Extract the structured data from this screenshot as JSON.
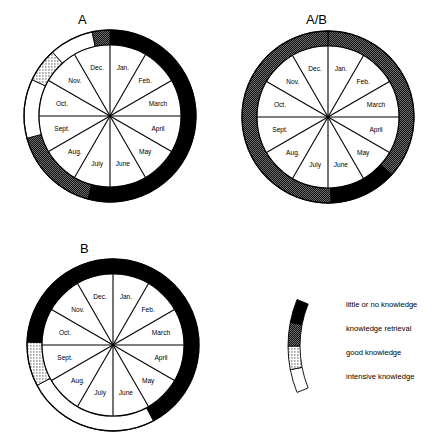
{
  "figure": {
    "background": "#ffffff",
    "ink": "#000000"
  },
  "panels": [
    {
      "id": "A",
      "title": "A",
      "title_x": 78,
      "title_y": 24,
      "cx": 110,
      "cy": 116,
      "r_outer": 86,
      "r_inner": 71,
      "months": [
        "Jan.",
        "Feb.",
        "March",
        "April",
        "May",
        "June",
        "July",
        "Aug.",
        "Sept.",
        "Oct.",
        "Nov.",
        "Dec."
      ],
      "ring": [
        {
          "from_deg": -90,
          "to_deg": 105,
          "fill": "intensive knowledge"
        },
        {
          "from_deg": 105,
          "to_deg": 165,
          "fill": "good knowledge"
        },
        {
          "from_deg": 165,
          "to_deg": 205,
          "fill": "little or no knowledge"
        },
        {
          "from_deg": 205,
          "to_deg": 228,
          "fill": "knowledge retrieval"
        },
        {
          "from_deg": 228,
          "to_deg": 258,
          "fill": "little or no knowledge"
        },
        {
          "from_deg": 258,
          "to_deg": 270,
          "fill": "good knowledge"
        }
      ]
    },
    {
      "id": "A/B",
      "title": "A/B",
      "title_x": 306,
      "title_y": 24,
      "cx": 328,
      "cy": 117,
      "r_outer": 86,
      "r_inner": 71,
      "months": [
        "Jan.",
        "Feb.",
        "March",
        "April",
        "May",
        "June",
        "July",
        "Aug.",
        "Sept.",
        "Oct.",
        "Nov.",
        "Dec."
      ],
      "ring": [
        {
          "from_deg": -90,
          "to_deg": 42,
          "fill": "good knowledge"
        },
        {
          "from_deg": 42,
          "to_deg": 88,
          "fill": "intensive knowledge"
        },
        {
          "from_deg": 88,
          "to_deg": 270,
          "fill": "good knowledge"
        }
      ]
    },
    {
      "id": "B",
      "title": "B",
      "title_x": 80,
      "title_y": 253,
      "cx": 113,
      "cy": 345,
      "r_outer": 86,
      "r_inner": 71,
      "months": [
        "Jan.",
        "Feb.",
        "March",
        "April",
        "May",
        "June",
        "July",
        "Aug.",
        "Sept.",
        "Oct.",
        "Nov.",
        "Dec."
      ],
      "ring": [
        {
          "from_deg": -90,
          "to_deg": 62,
          "fill": "intensive knowledge"
        },
        {
          "from_deg": 62,
          "to_deg": 152,
          "fill": "little or no knowledge"
        },
        {
          "from_deg": 152,
          "to_deg": 182,
          "fill": "knowledge retrieval"
        },
        {
          "from_deg": 182,
          "to_deg": 270,
          "fill": "intensive knowledge"
        }
      ]
    }
  ],
  "legend": {
    "swatch": {
      "x": 300,
      "y": 300,
      "width": 34,
      "height": 92
    },
    "items": [
      {
        "key": "little or no knowledge",
        "label": "little or no knowledge",
        "pattern": "white",
        "color": "#ffffff"
      },
      {
        "key": "knowledge retrieval",
        "label": "knowledge retrieval",
        "pattern": "dotted",
        "color": "#d8d8d8"
      },
      {
        "key": "good knowledge",
        "label": "good knowledge",
        "pattern": "hatched",
        "color": "#3a3a3a"
      },
      {
        "key": "intensive knowledge",
        "label": "intensive knowledge",
        "pattern": "solid",
        "color": "#000000"
      }
    ]
  }
}
